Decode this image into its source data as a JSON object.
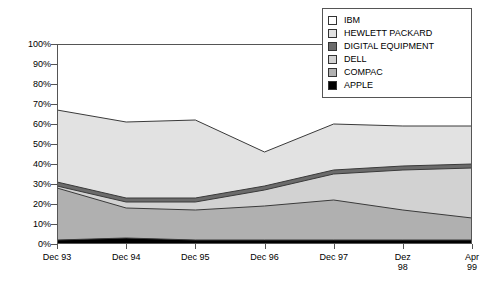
{
  "chart_data": {
    "type": "area",
    "title": "",
    "xlabel": "",
    "ylabel": "",
    "stacked": true,
    "grid": false,
    "legend_position": "top-right",
    "categories": [
      "Dec 93",
      "Dec 94",
      "Dec 95",
      "Dec 96",
      "Dec 97",
      "Dez\n98",
      "Apr\n99"
    ],
    "x_tick_labels": [
      "Dec 93",
      "Dec 94",
      "Dec 95",
      "Dec 96",
      "Dec 97",
      "Dez\n98",
      "Apr\n99"
    ],
    "y_tick_labels": [
      "100%",
      "90%",
      "80%",
      "70%",
      "60%",
      "50%",
      "40%",
      "30%",
      "20%",
      "10%",
      "0%"
    ],
    "y_tick_values": [
      100,
      90,
      80,
      70,
      60,
      50,
      40,
      30,
      20,
      10,
      0
    ],
    "ylim": [
      0,
      100
    ],
    "series": [
      {
        "name": "IBM",
        "color": "#ffffff",
        "values": [
          33,
          39,
          40,
          55,
          40,
          41,
          42
        ]
      },
      {
        "name": "HEWLETT PACKARD",
        "color": "#e2e2e2",
        "values": [
          36,
          38,
          39,
          17,
          23,
          20,
          19
        ]
      },
      {
        "name": "DIGITAL EQUIPMENT",
        "color": "#6b6b6b",
        "values": [
          2,
          2,
          2,
          2,
          2,
          2,
          2
        ]
      },
      {
        "name": "DELL",
        "color": "#d2d2d2",
        "values": [
          1,
          3,
          4,
          8,
          13,
          20,
          25
        ]
      },
      {
        "name": "COMPAC",
        "color": "#b0b0b0",
        "values": [
          26,
          15,
          15,
          17,
          20,
          15,
          11
        ]
      },
      {
        "name": "APPLE",
        "color": "#000000",
        "values": [
          2,
          3,
          2,
          2,
          2,
          2,
          2
        ]
      }
    ],
    "cumulative_upper_bounds": {
      "APPLE": [
        2,
        3,
        2,
        2,
        2,
        2,
        2
      ],
      "COMPAC": [
        28,
        18,
        17,
        19,
        22,
        17,
        13
      ],
      "DELL": [
        29,
        21,
        21,
        27,
        35,
        37,
        38
      ],
      "DIGITAL EQUIPMENT": [
        31,
        23,
        23,
        29,
        37,
        39,
        40
      ],
      "HEWLETT PACKARD": [
        67,
        61,
        62,
        46,
        60,
        59,
        59
      ],
      "IBM": [
        100,
        100,
        100,
        100,
        100,
        100,
        100
      ]
    }
  },
  "legend": {
    "items": [
      {
        "label": "IBM",
        "color": "#ffffff"
      },
      {
        "label": "HEWLETT PACKARD",
        "color": "#e2e2e2"
      },
      {
        "label": "DIGITAL EQUIPMENT",
        "color": "#6b6b6b"
      },
      {
        "label": "DELL",
        "color": "#d2d2d2"
      },
      {
        "label": "COMPAC",
        "color": "#b0b0b0"
      },
      {
        "label": "APPLE",
        "color": "#000000"
      }
    ]
  }
}
